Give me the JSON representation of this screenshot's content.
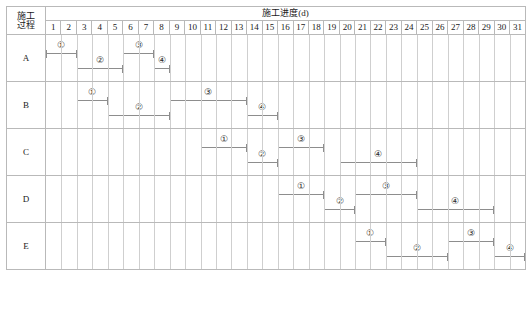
{
  "header": {
    "process_label_line1": "施工",
    "process_label_line2": "过程",
    "schedule_title": "施工进度(d)",
    "days": [
      "1",
      "2",
      "3",
      "4",
      "5",
      "6",
      "7",
      "8",
      "9",
      "10",
      "11",
      "12",
      "13",
      "14",
      "15",
      "16",
      "17",
      "18",
      "19",
      "20",
      "21",
      "22",
      "23",
      "24",
      "25",
      "26",
      "27",
      "28",
      "29",
      "30",
      "31"
    ]
  },
  "caption": "",
  "chart_data": {
    "type": "bar",
    "title": "施工进度(d)",
    "xlabel": "施工进度(d)",
    "ylabel": "施工过程",
    "x": [
      1,
      2,
      3,
      4,
      5,
      6,
      7,
      8,
      9,
      10,
      11,
      12,
      13,
      14,
      15,
      16,
      17,
      18,
      19,
      20,
      21,
      22,
      23,
      24,
      25,
      26,
      27,
      28,
      29,
      30,
      31
    ],
    "xlim": [
      1,
      31
    ],
    "grid": true,
    "legend": "none",
    "categories": [
      "A",
      "B",
      "C",
      "D",
      "E"
    ],
    "series": [
      {
        "name": "A",
        "bars": [
          {
            "label": "①",
            "start_day": 1,
            "end_day": 2,
            "duration": 2,
            "lane": "upper"
          },
          {
            "label": "②",
            "start_day": 3,
            "end_day": 5,
            "duration": 3,
            "lane": "lower"
          },
          {
            "label": "③",
            "start_day": 6,
            "end_day": 7,
            "duration": 2,
            "lane": "upper"
          },
          {
            "label": "④",
            "start_day": 8,
            "end_day": 8,
            "duration": 1,
            "lane": "lower"
          }
        ]
      },
      {
        "name": "B",
        "bars": [
          {
            "label": "①",
            "start_day": 3,
            "end_day": 4,
            "duration": 2,
            "lane": "upper"
          },
          {
            "label": "②",
            "start_day": 5,
            "end_day": 8,
            "duration": 4,
            "lane": "lower"
          },
          {
            "label": "③",
            "start_day": 9,
            "end_day": 13,
            "duration": 5,
            "lane": "upper"
          },
          {
            "label": "④",
            "start_day": 14,
            "end_day": 15,
            "duration": 2,
            "lane": "lower"
          }
        ]
      },
      {
        "name": "C",
        "bars": [
          {
            "label": "①",
            "start_day": 11,
            "end_day": 13,
            "duration": 3,
            "lane": "upper"
          },
          {
            "label": "②",
            "start_day": 14,
            "end_day": 15,
            "duration": 2,
            "lane": "lower"
          },
          {
            "label": "③",
            "start_day": 16,
            "end_day": 18,
            "duration": 3,
            "lane": "upper"
          },
          {
            "label": "④",
            "start_day": 20,
            "end_day": 24,
            "duration": 5,
            "lane": "lower"
          }
        ]
      },
      {
        "name": "D",
        "bars": [
          {
            "label": "①",
            "start_day": 16,
            "end_day": 18,
            "duration": 3,
            "lane": "upper"
          },
          {
            "label": "②",
            "start_day": 19,
            "end_day": 20,
            "duration": 2,
            "lane": "lower"
          },
          {
            "label": "③",
            "start_day": 21,
            "end_day": 24,
            "duration": 4,
            "lane": "upper"
          },
          {
            "label": "④",
            "start_day": 25,
            "end_day": 29,
            "duration": 5,
            "lane": "lower"
          }
        ]
      },
      {
        "name": "E",
        "bars": [
          {
            "label": "①",
            "start_day": 21,
            "end_day": 22,
            "duration": 2,
            "lane": "upper"
          },
          {
            "label": "②",
            "start_day": 23,
            "end_day": 26,
            "duration": 4,
            "lane": "lower"
          },
          {
            "label": "③",
            "start_day": 27,
            "end_day": 29,
            "duration": 3,
            "lane": "upper"
          },
          {
            "label": "④",
            "start_day": 30,
            "end_day": 31,
            "duration": 2,
            "lane": "lower"
          }
        ]
      }
    ]
  }
}
